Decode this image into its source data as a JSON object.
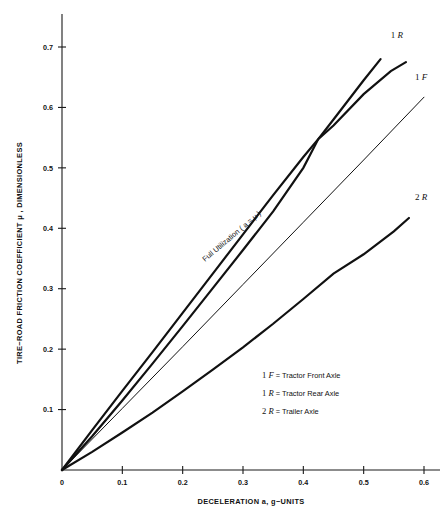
{
  "chart_data": {
    "type": "line",
    "title": "",
    "xlabel": "DECELERATION a, g−UNITS",
    "ylabel": "TIRE−ROAD FRICTION COEFFICIENT  μ , DIMENSIONLESS",
    "xlim": [
      0,
      0.62
    ],
    "ylim": [
      0,
      0.76
    ],
    "xticks": [
      0,
      0.1,
      0.2,
      0.3,
      0.4,
      0.5,
      0.6
    ],
    "xtick_labels": [
      "0",
      "0.1",
      "0.2",
      "0.3",
      "0.4",
      "0.5",
      "0.6"
    ],
    "yticks": [
      0.1,
      0.2,
      0.3,
      0.4,
      0.5,
      0.6,
      0.7
    ],
    "ytick_labels": [
      "0.1",
      "0.2",
      "0.3",
      "0.4",
      "0.5",
      "0.6",
      "0.7"
    ],
    "grid": false,
    "legend_position": "inside-lower-right",
    "series": [
      {
        "name": "1R",
        "label": "1 R",
        "description": "Tractor Rear Axle",
        "style": "thick",
        "x": [
          0,
          0.05,
          0.1,
          0.15,
          0.2,
          0.25,
          0.3,
          0.35,
          0.4,
          0.425,
          0.45,
          0.5,
          0.528
        ],
        "y": [
          0,
          0.066,
          0.131,
          0.195,
          0.26,
          0.325,
          0.39,
          0.455,
          0.518,
          0.548,
          0.58,
          0.645,
          0.68
        ]
      },
      {
        "name": "1F",
        "label": "1 F",
        "description": "Tractor Front Axle",
        "style": "thick",
        "x": [
          0,
          0.05,
          0.1,
          0.15,
          0.2,
          0.25,
          0.3,
          0.35,
          0.4,
          0.425,
          0.45,
          0.5,
          0.545,
          0.57
        ],
        "y": [
          0,
          0.056,
          0.115,
          0.176,
          0.238,
          0.301,
          0.364,
          0.428,
          0.5,
          0.548,
          0.57,
          0.622,
          0.66,
          0.675
        ]
      },
      {
        "name": "Full Utilization",
        "label": "Full Utilization ( a = μ )",
        "description": "Full utilization reference line where deceleration equals friction coefficient",
        "style": "thin",
        "x": [
          0,
          0.1,
          0.2,
          0.3,
          0.4,
          0.5,
          0.6
        ],
        "y": [
          0,
          0.102,
          0.204,
          0.307,
          0.41,
          0.513,
          0.617
        ]
      },
      {
        "name": "2R",
        "label": "2 R",
        "description": "Trailer Axle",
        "style": "thick",
        "x": [
          0,
          0.05,
          0.1,
          0.15,
          0.2,
          0.25,
          0.3,
          0.35,
          0.4,
          0.45,
          0.5,
          0.55,
          0.575
        ],
        "y": [
          0,
          0.03,
          0.062,
          0.095,
          0.13,
          0.166,
          0.203,
          0.242,
          0.283,
          0.325,
          0.357,
          0.395,
          0.417
        ]
      }
    ],
    "annotations": [
      {
        "name": "full-utilization-label",
        "text": "Full Utilization ( a = μ )",
        "at_x": 0.33,
        "at_y": 0.34
      }
    ],
    "curve_end_labels": [
      {
        "name": "1R",
        "prefix": "1",
        "symbol": "R",
        "at_x": 0.545,
        "at_y": 0.715
      },
      {
        "name": "1F",
        "prefix": "1",
        "symbol": "F",
        "at_x": 0.585,
        "at_y": 0.645
      },
      {
        "name": "2R",
        "prefix": "2",
        "symbol": "R",
        "at_x": 0.585,
        "at_y": 0.447
      }
    ]
  },
  "legend": {
    "entries": [
      {
        "prefix": "1",
        "symbol": "F",
        "equals": "=",
        "text": "Tractor Front Axle"
      },
      {
        "prefix": "1",
        "symbol": "R",
        "equals": "=",
        "text": "Tractor Rear Axle"
      },
      {
        "prefix": "2",
        "symbol": "R",
        "equals": "=",
        "text": "Trailer Axle"
      }
    ]
  }
}
